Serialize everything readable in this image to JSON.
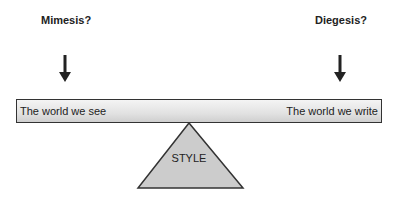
{
  "diagram": {
    "left_label": "Mimesis?",
    "right_label": "Diegesis?",
    "beam": {
      "left_text": "The world we see",
      "right_text": "The world we write"
    },
    "fulcrum_label": "STYLE",
    "colors": {
      "stroke": "#333333",
      "fulcrum_fill": "#cccccc",
      "beam_top": "#f4f4f4",
      "beam_bottom": "#cfcfcf"
    }
  }
}
